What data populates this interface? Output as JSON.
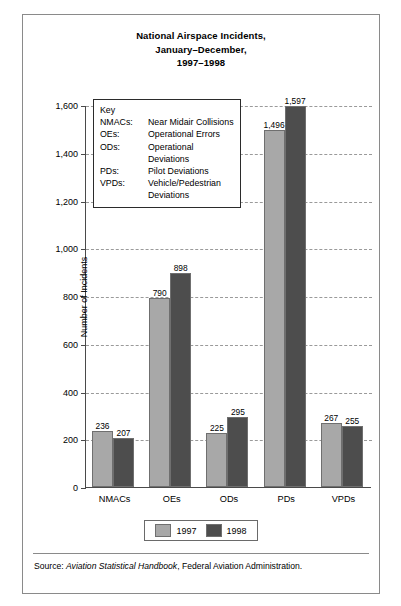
{
  "figure": {
    "title_lines": [
      "National Airspace Incidents,",
      "January–December,",
      "1997–1998"
    ],
    "axis_title": "Number of Incidents",
    "source_prefix": "Source: ",
    "source_italic": "Aviation Statistical Handbook",
    "source_suffix": ", Federal Aviation Administration."
  },
  "key": {
    "title": "Key",
    "entries": [
      {
        "abbr": "NMACs:",
        "desc": "Near Midair Collisions"
      },
      {
        "abbr": "OEs:",
        "desc": "Operational Errors"
      },
      {
        "abbr": "ODs:",
        "desc": "Operational Deviations"
      },
      {
        "abbr": "PDs:",
        "desc": "Pilot Deviations"
      },
      {
        "abbr": "VPDs:",
        "desc": "Vehicle/Pedestrian Deviations"
      }
    ]
  },
  "legend": {
    "items": [
      {
        "label": "1997",
        "color": "#a8a8a8"
      },
      {
        "label": "1998",
        "color": "#4d4d4d"
      }
    ]
  },
  "chart_data": {
    "type": "bar",
    "title": "National Airspace Incidents, January–December, 1997–1998",
    "xlabel": "",
    "ylabel": "Number of Incidents",
    "ylim": [
      0,
      1600
    ],
    "ytick_step": 200,
    "yticks": [
      0,
      200,
      400,
      600,
      800,
      1000,
      1200,
      1400,
      1600
    ],
    "ytick_labels": [
      "0",
      "200",
      "400",
      "600",
      "800",
      "1,000",
      "1,200",
      "1,400",
      "1,600"
    ],
    "grid": "horizontal-dashed",
    "legend_position": "bottom",
    "categories": [
      "NMACs",
      "OEs",
      "ODs",
      "PDs",
      "VPDs"
    ],
    "series": [
      {
        "name": "1997",
        "color": "#a8a8a8",
        "values": [
          236,
          790,
          225,
          1496,
          267
        ],
        "value_labels": [
          "236",
          "790",
          "225",
          "1,496",
          "267"
        ]
      },
      {
        "name": "1998",
        "color": "#4d4d4d",
        "values": [
          207,
          898,
          295,
          1597,
          255
        ],
        "value_labels": [
          "207",
          "898",
          "295",
          "1,597",
          "255"
        ]
      }
    ]
  }
}
